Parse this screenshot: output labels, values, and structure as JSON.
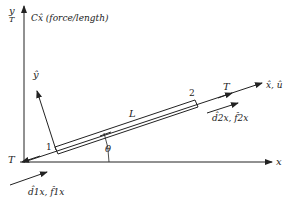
{
  "diagram": {
    "labels": {
      "y_axis": "y",
      "y_axis_force": "Cx̂ (force/length)",
      "y_axis_T": "T",
      "x_axis": "x",
      "local_x_axis": "x̂, û",
      "local_y_axis": "ŷ",
      "length": "L",
      "angle": "θ",
      "node1": "1",
      "node2": "2",
      "tension_left": "T",
      "tension_right": "T",
      "node1_dof": "d̂1x, f̂1x",
      "node2_dof": "d̂2x, f̂2x"
    },
    "colors": {
      "line": "#222222",
      "background": "#ffffff"
    }
  }
}
